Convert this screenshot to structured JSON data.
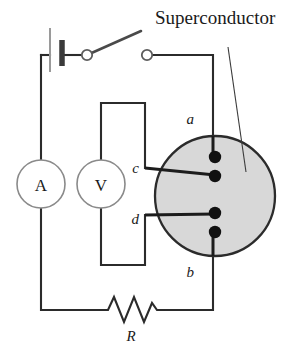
{
  "figure": {
    "title": "Superconductor",
    "width": 305,
    "height": 355,
    "background": "#ffffff"
  },
  "labels": {
    "node_a": "a",
    "node_b": "b",
    "node_c": "c",
    "node_d": "d",
    "resistor": "R",
    "ammeter": "A",
    "voltmeter": "V"
  },
  "components": {
    "battery": {
      "name": "battery",
      "symbol": "cell"
    },
    "switch": {
      "name": "switch",
      "state": "open"
    },
    "ammeter": {
      "name": "ammeter",
      "letter": "A"
    },
    "voltmeter": {
      "name": "voltmeter",
      "letter": "V"
    },
    "resistor": {
      "name": "resistor",
      "letter": "R",
      "symbol": "zigzag"
    },
    "sample": {
      "name": "superconductor-disk",
      "shape": "circle",
      "fill": "#d8d8d8",
      "stroke": "#2b2b2b",
      "contacts": [
        "a",
        "c",
        "d",
        "b"
      ],
      "contact_count": 4
    }
  },
  "colors": {
    "wire": "#2b2b2b",
    "disk_fill": "#d8d8d8",
    "disk_stroke": "#2b2b2b",
    "contact": "#111111",
    "text": "#1a1a1a",
    "meter_stroke": "#8a8a8a"
  }
}
